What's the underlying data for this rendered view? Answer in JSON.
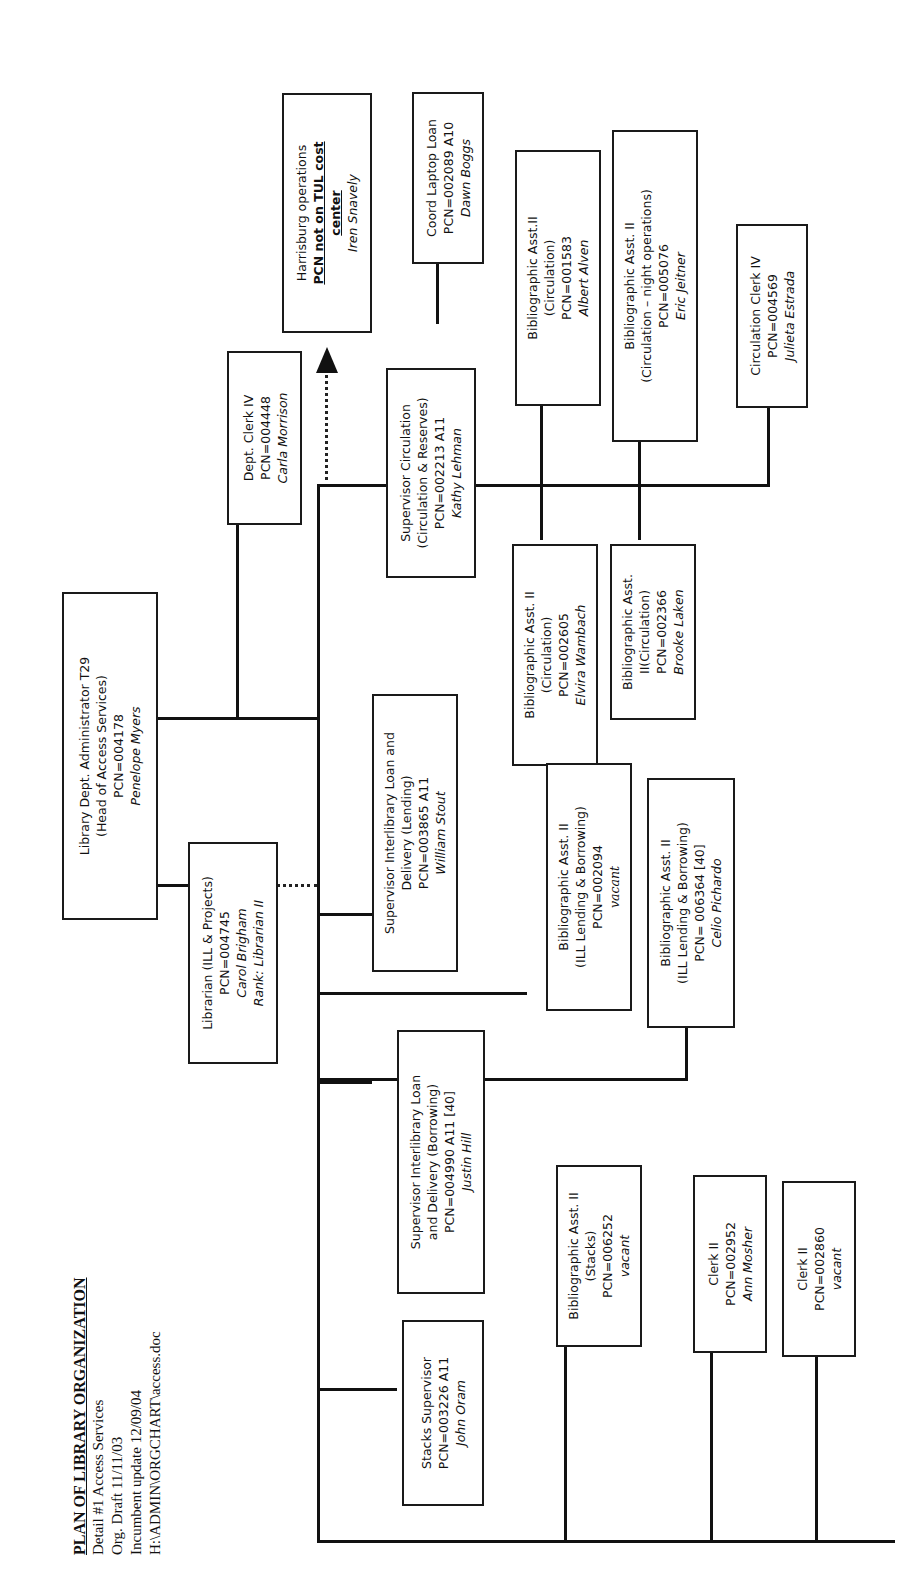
{
  "header": {
    "title": "PLAN OF LIBRARY ORGANIZATION",
    "lines": [
      "Detail #1 Access Services",
      "Org. Draft 11/11/03",
      "Incumbent update 12/09/04",
      "H:\\ADMIN\\ORGCHART\\access.doc"
    ]
  },
  "boxes": {
    "head": {
      "title": "Library Dept. Administrator T29",
      "subtitle": "(Head of Access Services)",
      "pcn": "PCN=004178",
      "name": "Penelope Myers"
    },
    "librarian": {
      "title": "Librarian (ILL & Projects)",
      "pcn": "PCN=004745",
      "name": "Carol Brigham",
      "rank": "Rank: Librarian II"
    },
    "dept_clerk": {
      "title": "Dept. Clerk IV",
      "pcn": "PCN=004448",
      "name": "Carla Morrison"
    },
    "harrisburg": {
      "title": "Harrisburg operations",
      "bold1": "PCN not on TUL cost",
      "bold2": "center",
      "name": "Iren Snavely"
    },
    "coord_laptop": {
      "title": "Coord Laptop Loan",
      "pcn": "PCN=002089   A10",
      "name": "Dawn Boggs"
    },
    "sup_circ": {
      "title": "Supervisor Circulation",
      "subtitle": "(Circulation & Reserves)",
      "pcn": "PCN=002213   A11",
      "name": "Kathy Lehman"
    },
    "ba_alven": {
      "title": "Bibliographic Asst.II",
      "subtitle": "(Circulation)",
      "pcn": "PCN=001583",
      "name": "Albert Alven"
    },
    "ba_jeitner": {
      "title": "Bibliographic Asst. II",
      "subtitle": "(Circulation – night operations)",
      "pcn": "PCN=005076",
      "name": "Eric Jeitner"
    },
    "circ_clerk": {
      "title": "Circulation  Clerk IV",
      "pcn": "PCN=004569",
      "name": "Julieta Estrada"
    },
    "ba_wambach": {
      "title": "Bibliographic Asst. II",
      "subtitle": "(Circulation)",
      "pcn": "PCN=002605",
      "name": "Elvira Wambach"
    },
    "ba_laken": {
      "title": "Bibliographic Asst.",
      "subtitle": "II(Circulation)",
      "pcn": "PCN=002366",
      "name": "Brooke Laken"
    },
    "sup_lending": {
      "title": "Supervisor Interlibrary Loan and",
      "subtitle": "Delivery (Lending)",
      "pcn": "PCN=003865 A11",
      "name": "William Stout"
    },
    "ba_ill_vacant": {
      "title": "Bibliographic Asst. II",
      "subtitle": "(ILL Lending & Borrowing)",
      "pcn": "PCN=002094",
      "name": "vacant"
    },
    "ba_pichardo": {
      "title": "Bibliographic Asst. II",
      "subtitle": "(ILL Lending & Borrowing)",
      "pcn": "PCN= 006364 [40]",
      "name": "Celio Pichardo"
    },
    "sup_borrowing": {
      "title": "Supervisor Interlibrary Loan",
      "subtitle": "and Delivery (Borrowing)",
      "pcn": "PCN=004990 A11 [40]",
      "name": "Justin Hill"
    },
    "stacks_sup": {
      "title": "Stacks  Supervisor",
      "pcn": "PCN=003226 A11",
      "name": "John Oram"
    },
    "ba_stacks": {
      "title": "Bibliographic Asst. II",
      "subtitle": "(Stacks)",
      "pcn": "PCN=006252",
      "name": "vacant"
    },
    "clerk_mosher": {
      "title": "Clerk II",
      "pcn": "PCN=002952",
      "name": "Ann Mosher"
    },
    "clerk_vacant": {
      "title": "Clerk II",
      "pcn": "PCN=002860",
      "name": "vacant"
    }
  }
}
